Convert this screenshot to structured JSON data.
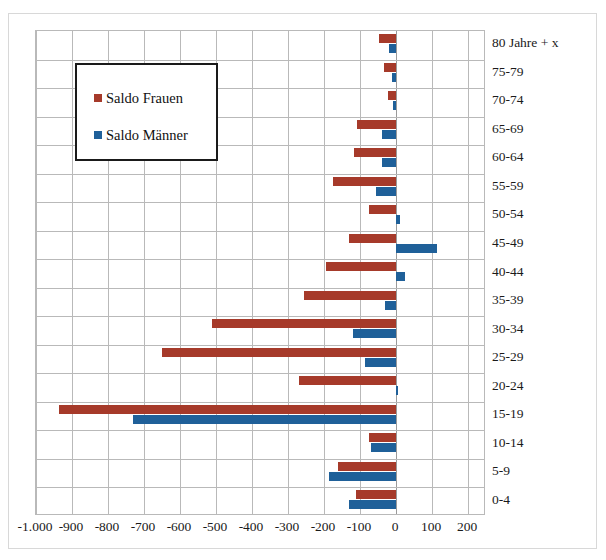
{
  "chart_data": {
    "type": "bar",
    "orientation": "horizontal",
    "title": "",
    "subtitle": "",
    "xlabel": "",
    "ylabel": "",
    "xlim": [
      -1000,
      250
    ],
    "grid": true,
    "legend_position": "upper-left-inside",
    "xticks": [
      -1000,
      -900,
      -800,
      -700,
      -600,
      -500,
      -400,
      -300,
      -200,
      -100,
      0,
      100,
      200
    ],
    "xticklabels": [
      "-1.000",
      "-900",
      "-800",
      "-700",
      "-600",
      "-500",
      "-400",
      "-300",
      "-200",
      "-100",
      "0",
      "100",
      "200"
    ],
    "categories": [
      "80 Jahre + x",
      "75-79",
      "70-74",
      "65-69",
      "60-64",
      "55-59",
      "50-54",
      "45-49",
      "40-44",
      "35-39",
      "30-34",
      "25-29",
      "20-24",
      "15-19",
      "10-14",
      "5-9",
      "0-4"
    ],
    "series": [
      {
        "name": "Saldo Frauen",
        "color": "#A63A2A",
        "values": [
          -48,
          -33,
          -22,
          -108,
          -118,
          -175,
          -75,
          -130,
          -195,
          -255,
          -510,
          -650,
          -270,
          -935,
          -75,
          -160,
          -110
        ]
      },
      {
        "name": "Saldo Männer",
        "color": "#1F6099",
        "values": [
          -20,
          -12,
          -8,
          -38,
          -40,
          -55,
          10,
          115,
          25,
          -30,
          -120,
          -85,
          5,
          -730,
          -70,
          -185,
          -130
        ]
      }
    ]
  },
  "legend": {
    "items": [
      {
        "label": "Saldo Frauen",
        "color": "#A63A2A",
        "icon": "square-swatch"
      },
      {
        "label": "Saldo Männer",
        "color": "#1F6099",
        "icon": "square-swatch"
      }
    ]
  },
  "colors": {
    "series_frauen": "#A63A2A",
    "series_maenner": "#1F6099",
    "grid": "#b9b9b9",
    "axis_text": "#1a1a1a",
    "plot_background": "#ffffff",
    "legend_border": "#1a1a1a"
  }
}
